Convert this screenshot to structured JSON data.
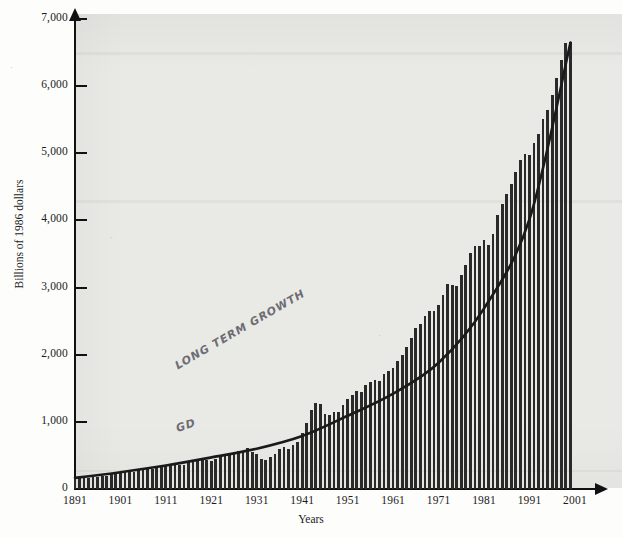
{
  "figure": {
    "y_axis_title": "Billions of 1986 dollars",
    "x_axis_title": "Years"
  },
  "annotations": {
    "long_term_growth": "LONG TERM GROWTH",
    "great_depression": "GD"
  },
  "marks": {
    "speck_top_left": "·",
    "speck_mid_left": "·",
    "speck_mid_right": "·"
  },
  "chart_data": {
    "type": "bar",
    "title": "",
    "xlabel": "Years",
    "ylabel": "Billions of 1986 dollars",
    "xlim": [
      1891,
      2001
    ],
    "ylim": [
      0,
      7000
    ],
    "ytick_labels": [
      "0",
      "1,000",
      "2,000",
      "3,000",
      "4,000",
      "5,000",
      "6,000",
      "7,000"
    ],
    "yticks": [
      0,
      1000,
      2000,
      3000,
      4000,
      5000,
      6000,
      7000
    ],
    "xtick_labels": [
      "1891",
      "1901",
      "1911",
      "1921",
      "1931",
      "1941",
      "1951",
      "1961",
      "1971",
      "1981",
      "1991",
      "2001"
    ],
    "xticks": [
      1891,
      1901,
      1911,
      1921,
      1931,
      1941,
      1951,
      1961,
      1971,
      1981,
      1991,
      2001
    ],
    "grid": false,
    "legend": "none",
    "bar_color": "#2a2a2a",
    "curve_color": "#1a1a1a",
    "background_color": "#e9e9e6",
    "series": [
      {
        "name": "Real GDP",
        "x": [
          1891,
          1892,
          1893,
          1894,
          1895,
          1896,
          1897,
          1898,
          1899,
          1900,
          1901,
          1902,
          1903,
          1904,
          1905,
          1906,
          1907,
          1908,
          1909,
          1910,
          1911,
          1912,
          1913,
          1914,
          1915,
          1916,
          1917,
          1918,
          1919,
          1920,
          1921,
          1922,
          1923,
          1924,
          1925,
          1926,
          1927,
          1928,
          1929,
          1930,
          1931,
          1932,
          1933,
          1934,
          1935,
          1936,
          1937,
          1938,
          1939,
          1940,
          1941,
          1942,
          1943,
          1944,
          1945,
          1946,
          1947,
          1948,
          1949,
          1950,
          1951,
          1952,
          1953,
          1954,
          1955,
          1956,
          1957,
          1958,
          1959,
          1960,
          1961,
          1962,
          1963,
          1964,
          1965,
          1966,
          1967,
          1968,
          1969,
          1970,
          1971,
          1972,
          1973,
          1974,
          1975,
          1976,
          1977,
          1978,
          1979,
          1980,
          1981,
          1982,
          1983,
          1984,
          1985,
          1986,
          1987,
          1988,
          1989,
          1990,
          1991,
          1992,
          1993,
          1994,
          1995,
          1996,
          1997,
          1998,
          1999,
          2000
        ],
        "values": [
          160,
          172,
          166,
          162,
          180,
          176,
          192,
          200,
          218,
          222,
          248,
          254,
          262,
          260,
          282,
          312,
          318,
          292,
          330,
          336,
          348,
          368,
          382,
          352,
          362,
          412,
          402,
          436,
          440,
          436,
          424,
          450,
          508,
          512,
          524,
          558,
          562,
          568,
          606,
          552,
          516,
          446,
          438,
          484,
          528,
          598,
          628,
          602,
          650,
          706,
          828,
          980,
          1180,
          1280,
          1260,
          1118,
          1106,
          1152,
          1142,
          1248,
          1348,
          1400,
          1466,
          1452,
          1556,
          1588,
          1620,
          1606,
          1718,
          1760,
          1800,
          1910,
          1994,
          2110,
          2246,
          2392,
          2452,
          2572,
          2652,
          2654,
          2740,
          2886,
          3052,
          3036,
          3020,
          3186,
          3332,
          3514,
          3626,
          3616,
          3708,
          3636,
          3800,
          4074,
          4244,
          4392,
          4542,
          4728,
          4896,
          4990,
          4980,
          5148,
          5292,
          5512,
          5648,
          5862,
          6124,
          6396,
          6648,
          6660
        ]
      },
      {
        "name": "Long-term growth trend",
        "type": "line",
        "x": [
          1891,
          1901,
          1911,
          1921,
          1931,
          1941,
          1951,
          1961,
          1971,
          1981,
          1991,
          2000
        ],
        "values": [
          165,
          250,
          350,
          470,
          600,
          790,
          1090,
          1420,
          1880,
          2690,
          4020,
          6650
        ]
      }
    ],
    "notes": [
      "Bars show annual real GDP; hand-drawn smooth curve shows long-term growth trend.",
      "Dip near 1931-1933 labeled GD (Great Depression); spike near 1944 from WWII."
    ]
  }
}
